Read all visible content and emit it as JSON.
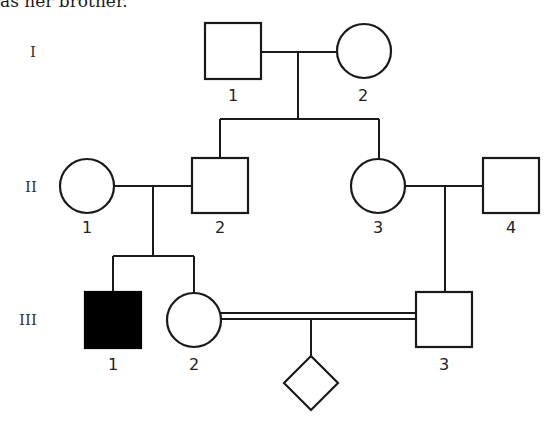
{
  "caption": "as her brother.",
  "generations": [
    {
      "label": "I"
    },
    {
      "label": "II"
    },
    {
      "label": "III"
    }
  ],
  "individuals": {
    "I_1": {
      "label": "1",
      "sex": "male",
      "affected": false
    },
    "I_2": {
      "label": "2",
      "sex": "female",
      "affected": false
    },
    "II_1": {
      "label": "1",
      "sex": "female",
      "affected": false
    },
    "II_2": {
      "label": "2",
      "sex": "male",
      "affected": false
    },
    "II_3": {
      "label": "3",
      "sex": "female",
      "affected": false
    },
    "II_4": {
      "label": "4",
      "sex": "male",
      "affected": false
    },
    "III_1": {
      "label": "1",
      "sex": "male",
      "affected": true
    },
    "III_2": {
      "label": "2",
      "sex": "female",
      "affected": false
    },
    "III_3": {
      "label": "3",
      "sex": "male",
      "affected": false
    },
    "IV_child": {
      "label": "",
      "sex": "unknown",
      "affected": false
    }
  },
  "relationships": [
    {
      "partners": [
        "I_1",
        "I_2"
      ],
      "children": [
        "II_2",
        "II_3"
      ],
      "consanguineous": false
    },
    {
      "partners": [
        "II_1",
        "II_2"
      ],
      "children": [
        "III_1",
        "III_2"
      ],
      "consanguineous": false
    },
    {
      "partners": [
        "II_3",
        "II_4"
      ],
      "children": [
        "III_3"
      ],
      "consanguineous": false
    },
    {
      "partners": [
        "III_2",
        "III_3"
      ],
      "children": [
        "IV_child"
      ],
      "consanguineous": true
    }
  ],
  "colors": {
    "stroke": "#1a1a1a",
    "affected_fill": "#000000",
    "background": "#ffffff"
  }
}
